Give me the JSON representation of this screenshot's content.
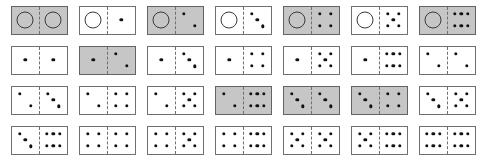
{
  "layout": {
    "rows": 4,
    "columns": 7,
    "total_tiles": 28,
    "tile_width_px": 57,
    "tile_height_px": 29
  },
  "colors": {
    "tile_fill_white": "#ffffff",
    "tile_fill_shaded": "#c6c6c6",
    "tile_border": "#6f6f6f",
    "pip": "#111111",
    "zero_circle_stroke": "#3a3a3a",
    "background": "#ffffff"
  },
  "pip_layouts": {
    "0": [],
    "1": [
      [
        50,
        50
      ]
    ],
    "2": [
      [
        30,
        28
      ],
      [
        70,
        72
      ]
    ],
    "3": [
      [
        30,
        26
      ],
      [
        50,
        50
      ],
      [
        70,
        74
      ]
    ],
    "4": [
      [
        30,
        28
      ],
      [
        70,
        28
      ],
      [
        30,
        72
      ],
      [
        70,
        72
      ]
    ],
    "5": [
      [
        30,
        28
      ],
      [
        70,
        28
      ],
      [
        50,
        50
      ],
      [
        30,
        72
      ],
      [
        70,
        72
      ]
    ],
    "6": [
      [
        26,
        28
      ],
      [
        50,
        28
      ],
      [
        74,
        28
      ],
      [
        26,
        72
      ],
      [
        50,
        72
      ],
      [
        74,
        72
      ]
    ]
  },
  "zero_glyph": "open-circle",
  "rows": [
    {
      "index": 1,
      "tiles": [
        {
          "name": "domino-0-0",
          "left": 0,
          "right": 0,
          "shaded": true
        },
        {
          "name": "domino-0-1",
          "left": 0,
          "right": 1,
          "shaded": false
        },
        {
          "name": "domino-0-2",
          "left": 0,
          "right": 2,
          "shaded": true
        },
        {
          "name": "domino-0-3",
          "left": 0,
          "right": 3,
          "shaded": false
        },
        {
          "name": "domino-0-4",
          "left": 0,
          "right": 4,
          "shaded": true
        },
        {
          "name": "domino-0-5",
          "left": 0,
          "right": 5,
          "shaded": false
        },
        {
          "name": "domino-0-6",
          "left": 0,
          "right": 6,
          "shaded": true
        }
      ]
    },
    {
      "index": 2,
      "tiles": [
        {
          "name": "domino-1-1",
          "left": 1,
          "right": 1,
          "shaded": false
        },
        {
          "name": "domino-1-2",
          "left": 1,
          "right": 2,
          "shaded": true
        },
        {
          "name": "domino-1-3",
          "left": 1,
          "right": 3,
          "shaded": false
        },
        {
          "name": "domino-1-4",
          "left": 1,
          "right": 4,
          "shaded": false
        },
        {
          "name": "domino-1-5",
          "left": 1,
          "right": 5,
          "shaded": false
        },
        {
          "name": "domino-1-6",
          "left": 1,
          "right": 6,
          "shaded": false
        },
        {
          "name": "domino-2-2",
          "left": 2,
          "right": 2,
          "shaded": false
        }
      ]
    },
    {
      "index": 3,
      "tiles": [
        {
          "name": "domino-2-3",
          "left": 2,
          "right": 3,
          "shaded": false
        },
        {
          "name": "domino-2-4",
          "left": 2,
          "right": 4,
          "shaded": false
        },
        {
          "name": "domino-2-5",
          "left": 2,
          "right": 5,
          "shaded": false
        },
        {
          "name": "domino-2-6",
          "left": 2,
          "right": 6,
          "shaded": true
        },
        {
          "name": "domino-3-3",
          "left": 3,
          "right": 3,
          "shaded": true
        },
        {
          "name": "domino-3-4",
          "left": 3,
          "right": 4,
          "shaded": true
        },
        {
          "name": "domino-3-5",
          "left": 3,
          "right": 5,
          "shaded": false
        }
      ]
    },
    {
      "index": 4,
      "tiles": [
        {
          "name": "domino-3-6",
          "left": 3,
          "right": 6,
          "shaded": false
        },
        {
          "name": "domino-4-4",
          "left": 4,
          "right": 4,
          "shaded": false
        },
        {
          "name": "domino-4-5",
          "left": 4,
          "right": 5,
          "shaded": false
        },
        {
          "name": "domino-4-6",
          "left": 4,
          "right": 6,
          "shaded": false
        },
        {
          "name": "domino-5-5",
          "left": 5,
          "right": 5,
          "shaded": false
        },
        {
          "name": "domino-5-6",
          "left": 5,
          "right": 6,
          "shaded": false
        },
        {
          "name": "domino-6-6",
          "left": 6,
          "right": 6,
          "shaded": false
        }
      ]
    }
  ]
}
